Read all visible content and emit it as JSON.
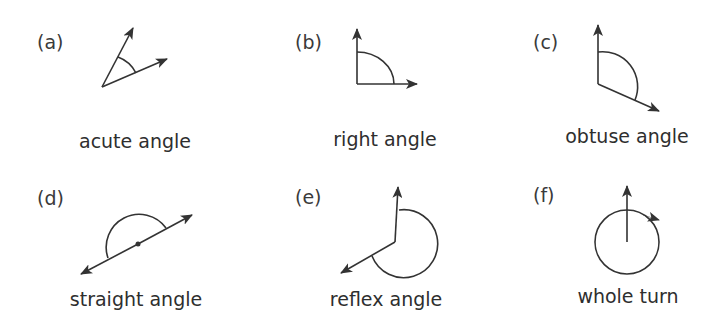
{
  "panels": [
    {
      "id": "a",
      "label": "(a)",
      "caption": "acute angle"
    },
    {
      "id": "b",
      "label": "(b)",
      "caption": "right angle"
    },
    {
      "id": "c",
      "label": "(c)",
      "caption": "obtuse angle"
    },
    {
      "id": "d",
      "label": "(d)",
      "caption": "straight angle"
    },
    {
      "id": "e",
      "label": "(e)",
      "caption": "reflex angle"
    },
    {
      "id": "f",
      "label": "(f)",
      "caption": "whole turn"
    }
  ],
  "colors": {
    "stroke": "#333333",
    "background": "#ffffff"
  }
}
